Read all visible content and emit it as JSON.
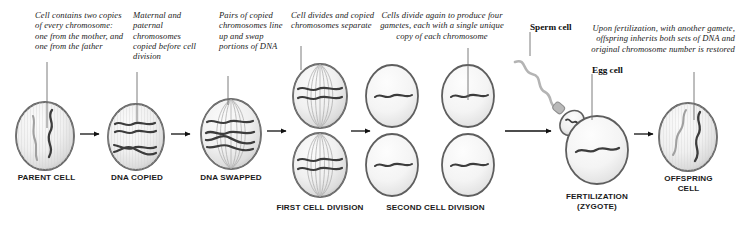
{
  "diagram": {
    "palette": {
      "cell_fill_light": "#f4f4f4",
      "cell_fill_mid": "#e2e2e2",
      "cell_edge": "#5a5a5a",
      "chromosome_dark": "#3a3a3a",
      "chromosome_light": "#9a9a9a",
      "arrow": "#111111",
      "leader": "#6e6e6e",
      "text": "#1a1a1a"
    },
    "notes": [
      {
        "id": "note-parent",
        "text": "Cell contains two copies of every chromosome: one from the mother, and one from the father",
        "align": "left"
      },
      {
        "id": "note-copied",
        "text": "Maternal and paternal chromosomes copied before cell division",
        "align": "left"
      },
      {
        "id": "note-swapped",
        "text": "Pairs of copied chromosomes line up and swap portions of DNA",
        "align": "left"
      },
      {
        "id": "note-first-division",
        "text": "Cell divides and copied chromosomes separate",
        "align": "left"
      },
      {
        "id": "note-second-division",
        "text": "Cells divide again to produce four gametes, each with a single unique copy of each chromosome",
        "align": "center"
      },
      {
        "id": "note-fertilization",
        "text": "Upon fertilization, with another gamete, offspring inherits both sets of DNA and original chromosome number is restored",
        "align": "right"
      }
    ],
    "tags": [
      {
        "id": "tag-sperm",
        "text": "Sperm cell"
      },
      {
        "id": "tag-egg",
        "text": "Egg cell"
      }
    ],
    "captions": [
      {
        "id": "caption-parent-cell",
        "text": "PARENT CELL"
      },
      {
        "id": "caption-dna-copied",
        "text": "DNA COPIED"
      },
      {
        "id": "caption-dna-swapped",
        "text": "DNA SWAPPED"
      },
      {
        "id": "caption-first-cell-division",
        "text": "FIRST CELL DIVISION"
      },
      {
        "id": "caption-second-cell-division",
        "text": "SECOND CELL DIVISION"
      },
      {
        "id": "caption-fertilization",
        "text": "FERTILIZATION\n(ZYGOTE)"
      },
      {
        "id": "caption-offspring-cell",
        "text": "OFFSPRING\nCELL"
      }
    ],
    "stages": [
      {
        "id": "parent-cell",
        "cells": 1,
        "chromosomes": 2,
        "spindle": false
      },
      {
        "id": "dna-copied",
        "cells": 1,
        "chromosomes": 4,
        "spindle": false
      },
      {
        "id": "dna-swapped",
        "cells": 1,
        "chromosomes": 4,
        "spindle": true
      },
      {
        "id": "first-cell-division",
        "cells": 2,
        "chromosomes": 2,
        "spindle": true
      },
      {
        "id": "second-cell-division",
        "cells": 4,
        "chromosomes": 1,
        "spindle": false
      },
      {
        "id": "fertilization",
        "cells": 1,
        "chromosomes": 1,
        "spindle": false
      },
      {
        "id": "offspring-cell",
        "cells": 1,
        "chromosomes": 2,
        "spindle": false
      }
    ]
  }
}
